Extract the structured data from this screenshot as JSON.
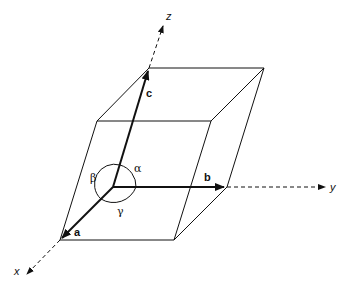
{
  "diagram": {
    "type": "unit-cell-parallelepiped",
    "axes": [
      {
        "name": "x",
        "label": "x"
      },
      {
        "name": "y",
        "label": "y"
      },
      {
        "name": "z",
        "label": "z"
      }
    ],
    "vectors": [
      {
        "name": "a",
        "label": "a"
      },
      {
        "name": "b",
        "label": "b"
      },
      {
        "name": "c",
        "label": "c"
      }
    ],
    "angles": [
      {
        "name": "alpha",
        "label": "α"
      },
      {
        "name": "beta",
        "label": "β"
      },
      {
        "name": "gamma",
        "label": "γ"
      }
    ],
    "colors": {
      "line": "#111111",
      "background": "#ffffff"
    }
  }
}
